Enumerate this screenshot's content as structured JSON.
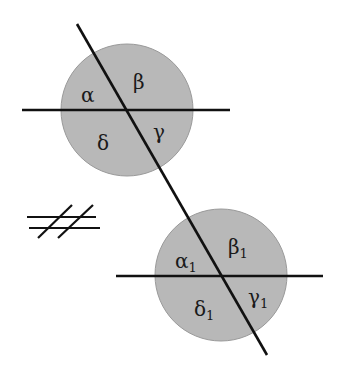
{
  "diagram": {
    "colors": {
      "circle_fill": "#b8b8b8",
      "circle_stroke": "#999999",
      "line": "#111111",
      "background": "#ffffff"
    },
    "top_intersection": {
      "labels": {
        "alpha": "α",
        "beta": "β",
        "gamma": "γ",
        "delta": "δ"
      }
    },
    "bottom_intersection": {
      "labels": {
        "alpha": "α",
        "beta": "β",
        "gamma": "γ",
        "delta": "δ"
      },
      "subscript": "1"
    },
    "symbol": {
      "name": "not-parallel",
      "meaning": "lines are not parallel"
    }
  }
}
